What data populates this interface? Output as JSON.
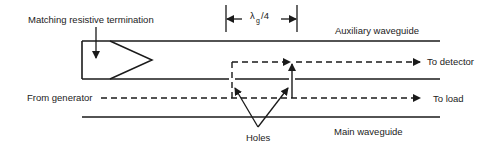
{
  "diagram": {
    "labels": {
      "termination": "Matching resistive termination",
      "auxiliary": "Auxiliary waveguide",
      "main": "Main waveguide",
      "from_generator": "From generator",
      "to_detector": "To detector",
      "to_load": "To load",
      "holes": "Holes",
      "spacing_symbol": "λ",
      "spacing_subscript": "g",
      "spacing_suffix": "/4"
    },
    "colors": {
      "stroke": "#1a1a1a",
      "text": "#222222"
    }
  }
}
